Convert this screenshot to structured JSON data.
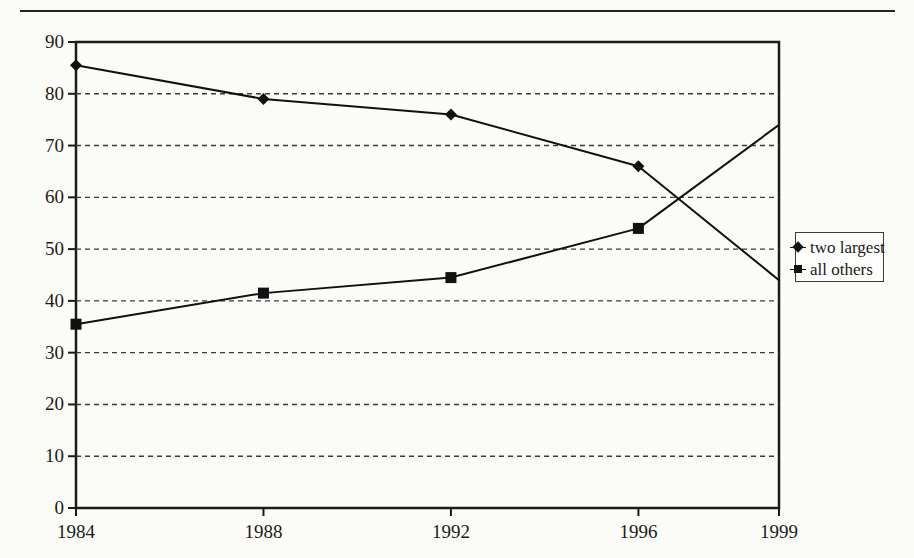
{
  "figure": {
    "background_color": "#fbfbf8",
    "ink_color": "#1b1b1b",
    "top_rule": true
  },
  "chart_data": {
    "type": "line",
    "title": "",
    "xlabel": "",
    "ylabel": "",
    "x": [
      1984,
      1988,
      1992,
      1996,
      1999
    ],
    "categories": [
      "1984",
      "1988",
      "1992",
      "1996",
      "1999"
    ],
    "xtick_labels": [
      "1984",
      "1988",
      "1992",
      "1996",
      "1999"
    ],
    "ytick_labels": [
      "0",
      "10",
      "20",
      "30",
      "40",
      "50",
      "60",
      "70",
      "80",
      "90"
    ],
    "yticks": [
      0,
      10,
      20,
      30,
      40,
      50,
      60,
      70,
      80,
      90
    ],
    "ylim": [
      0,
      90
    ],
    "xlim": [
      1984,
      1999
    ],
    "grid": "horizontal-dashed",
    "legend_position": "right-outside",
    "series": [
      {
        "name": "two largest",
        "marker": "diamond",
        "values": [
          85.5,
          79.0,
          76.0,
          66.0,
          44.0
        ],
        "labeled_points": [
          1984,
          1988,
          1992,
          1996
        ]
      },
      {
        "name": "all others",
        "marker": "square",
        "values": [
          35.5,
          41.5,
          44.5,
          54.0,
          74.0
        ],
        "labeled_points": [
          1984,
          1988,
          1992,
          1996
        ]
      }
    ]
  },
  "legend": {
    "entries": [
      {
        "label": "two largest",
        "marker": "diamond"
      },
      {
        "label": "all others",
        "marker": "square"
      }
    ]
  },
  "axis": {
    "y_labels": [
      {
        "value": 90,
        "text": "90"
      },
      {
        "value": 80,
        "text": "80"
      },
      {
        "value": 70,
        "text": "70"
      },
      {
        "value": 60,
        "text": "60"
      },
      {
        "value": 50,
        "text": "50"
      },
      {
        "value": 40,
        "text": "40"
      },
      {
        "value": 30,
        "text": "30"
      },
      {
        "value": 20,
        "text": "20"
      },
      {
        "value": 10,
        "text": "10"
      },
      {
        "value": 0,
        "text": "0"
      }
    ],
    "x_labels": [
      {
        "value": 1984,
        "text": "1984"
      },
      {
        "value": 1988,
        "text": "1988"
      },
      {
        "value": 1992,
        "text": "1992"
      },
      {
        "value": 1996,
        "text": "1996"
      },
      {
        "value": 1999,
        "text": "1999"
      }
    ]
  }
}
